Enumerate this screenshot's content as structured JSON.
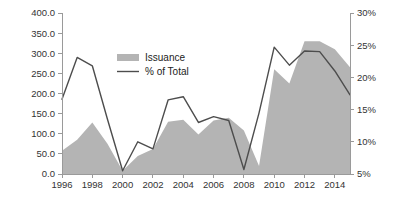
{
  "chart_data": {
    "type": "area",
    "title": "",
    "subtitle": "",
    "xlabel": "",
    "ylabel": "",
    "y2label": "",
    "grid": false,
    "legend_position": "inside-top-left",
    "x": [
      1996,
      1997,
      1998,
      1999,
      2000,
      2001,
      2002,
      2003,
      2004,
      2005,
      2006,
      2007,
      2008,
      2009,
      2010,
      2011,
      2012,
      2013,
      2014,
      2015
    ],
    "xlim": [
      1996,
      2015
    ],
    "xticks": [
      1996,
      1998,
      2000,
      2002,
      2004,
      2006,
      2008,
      2010,
      2012,
      2014
    ],
    "xtick_labels": [
      "1996",
      "1998",
      "2000",
      "2002",
      "2004",
      "2006",
      "2008",
      "2010",
      "2012",
      "2014"
    ],
    "ylim": [
      0,
      400
    ],
    "yticks": [
      0,
      50,
      100,
      150,
      200,
      250,
      300,
      350,
      400
    ],
    "ytick_labels": [
      "0.0",
      "50.0",
      "100.0",
      "150.0",
      "200.0",
      "250.0",
      "300.0",
      "350.0",
      "400.0"
    ],
    "y2lim": [
      5,
      30
    ],
    "y2ticks": [
      5,
      10,
      15,
      20,
      25,
      30
    ],
    "y2tick_labels": [
      "5%",
      "10%",
      "15%",
      "20%",
      "25%",
      "30%"
    ],
    "series": [
      {
        "name": "Issuance",
        "type": "area",
        "axis": "left",
        "color": "#b4b4b4",
        "values": [
          58,
          85,
          128,
          75,
          8,
          45,
          62,
          130,
          135,
          98,
          133,
          140,
          108,
          20,
          260,
          225,
          330,
          330,
          310,
          265
        ]
      },
      {
        "name": "% of Total",
        "type": "line",
        "axis": "right",
        "color": "#4d4d4d",
        "values": [
          16.6,
          23.1,
          21.8,
          13.5,
          5.5,
          10.0,
          8.9,
          16.5,
          17.0,
          13.0,
          13.9,
          13.3,
          5.7,
          14.5,
          24.7,
          21.9,
          24.1,
          24.0,
          21.0,
          17.3
        ]
      }
    ],
    "legend": [
      {
        "label": "Issuance",
        "marker": "swatch",
        "color": "#b4b4b4"
      },
      {
        "label": "% of Total",
        "marker": "line",
        "color": "#4d4d4d"
      }
    ]
  },
  "axes": {
    "left_axis_name": "issuance-axis",
    "right_axis_name": "percent-axis",
    "bottom_axis_name": "year-axis"
  }
}
